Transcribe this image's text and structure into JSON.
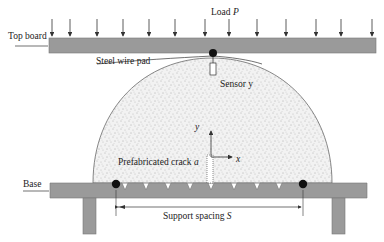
{
  "diagram": {
    "labels": {
      "load": "Load ",
      "load_symbol": "P",
      "top_board": "Top board",
      "steel_wire_pad": "Steel wire pad",
      "sensor": "Sensor ",
      "sensor_symbol": "y",
      "axis_y": "y",
      "axis_x": "x",
      "crack": "Prefabricated crack ",
      "crack_symbol": "a",
      "base": "Base",
      "support_spacing": "Support spacing ",
      "support_symbol": "S"
    },
    "load_arrows_count": 13,
    "base_notches_count": 8,
    "colors": {
      "board": "#9a9a9a",
      "board_edge": "#707070",
      "specimen_fill": "#f1f1f1",
      "specimen_speckle": "#777777",
      "support_ball": "#111111",
      "line": "#333333"
    }
  }
}
